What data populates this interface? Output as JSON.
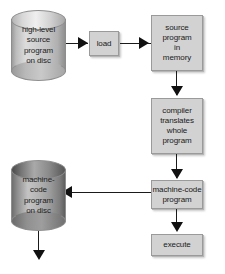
{
  "diagram": {
    "background_color": "#ffffff",
    "nodes": {
      "source_disc": {
        "label": "high-level\nsource\nprogram\non disc",
        "line1": "high-level",
        "line2": "source",
        "line3": "program",
        "line4": "on disc",
        "shape": "cylinder",
        "style": "light-disc"
      },
      "load": {
        "label": "load",
        "shape": "rectangle"
      },
      "source_memory": {
        "line1": "source",
        "line2": "program",
        "line3": "in",
        "line4": "memory",
        "shape": "rectangle"
      },
      "compiler": {
        "line1": "compiler",
        "line2": "translates",
        "line3": "whole",
        "line4": "program",
        "shape": "rectangle"
      },
      "machine_code_program": {
        "line1": "machine-code",
        "line2": "program",
        "shape": "rectangle"
      },
      "execute": {
        "label": "execute",
        "shape": "rectangle"
      },
      "machine_code_disc": {
        "line1": "machine-",
        "line2": "code",
        "line3": "program",
        "line4": "on disc",
        "shape": "cylinder",
        "style": "dark-disc"
      }
    },
    "edges": [
      {
        "from": "source_disc",
        "to": "load",
        "direction": "right"
      },
      {
        "from": "load",
        "to": "source_memory",
        "direction": "right"
      },
      {
        "from": "source_memory",
        "to": "compiler",
        "direction": "down"
      },
      {
        "from": "compiler",
        "to": "machine_code_program",
        "direction": "down"
      },
      {
        "from": "machine_code_program",
        "to": "machine_code_disc",
        "direction": "left"
      },
      {
        "from": "machine_code_program",
        "to": "execute",
        "direction": "down"
      },
      {
        "from": "machine_code_disc",
        "to": "",
        "direction": "down"
      }
    ],
    "colors": {
      "box_fill": "#d2d2d2",
      "box_border": "#9a9a9a",
      "arrow": "#111111",
      "text": "#1a1a1a"
    }
  }
}
